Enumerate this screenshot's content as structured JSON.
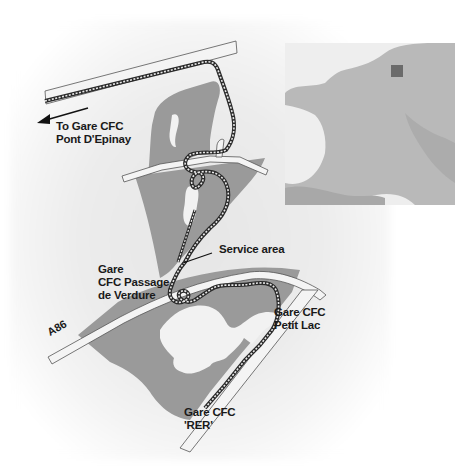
{
  "map": {
    "title": "Parc Floral train route map",
    "colors": {
      "park": "#9a9a9a",
      "lake": "#f2f2f2",
      "road_fill": "#f4f4f4",
      "road_stroke": "#555555",
      "track": "#2a2a2a",
      "inset_land": "#b5b5b5",
      "inset_highlight": "#6b6b6b",
      "text": "#1a1a1a"
    },
    "labels": {
      "pont_epinay_line1": "To Gare CFC",
      "pont_epinay_line2": "Pont D'Epinay",
      "service_area": "Service area",
      "passage_line1": "Gare",
      "passage_line2": "CFC Passage",
      "passage_line3": "de Verdure",
      "road_a86": "A86",
      "petit_lac_line1": "Gare CFC",
      "petit_lac_line2": "Petit Lac",
      "rer_line1": "Gare CFC",
      "rer_line2": "'RER'"
    },
    "icons": {
      "direction_arrow": "arrow-left",
      "location_marker": "square"
    },
    "inset": {
      "region": "France",
      "marker": "study area location"
    }
  }
}
